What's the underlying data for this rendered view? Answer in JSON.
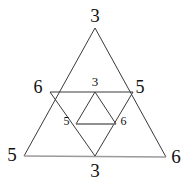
{
  "figure": {
    "name": "nested-triangles-diagram",
    "background_color": "#ffffff",
    "stroke_dark": "#3a3a3a",
    "stroke_light": "#9a9a9a",
    "text_color": "#111111",
    "labels": {
      "top_outer": "3",
      "left_outer": "5",
      "right_outer": "6",
      "left_mid": "6",
      "right_mid": "5",
      "bottom_mid": "3",
      "inner_top": "3",
      "inner_left": "5",
      "inner_right": "6"
    },
    "geometry": {
      "outer_triangle": {
        "apex": [
          95,
          28
        ],
        "bottom_left": [
          24,
          156
        ],
        "bottom_right": [
          166,
          157
        ]
      },
      "medial_triangle": {
        "left": [
          50,
          92
        ],
        "right": [
          133,
          92
        ],
        "bottom": [
          95,
          156
        ]
      },
      "inner_triangle": {
        "apex": [
          95,
          92
        ],
        "bottom_left": [
          76,
          124
        ],
        "bottom_right": [
          116,
          124
        ]
      }
    }
  }
}
